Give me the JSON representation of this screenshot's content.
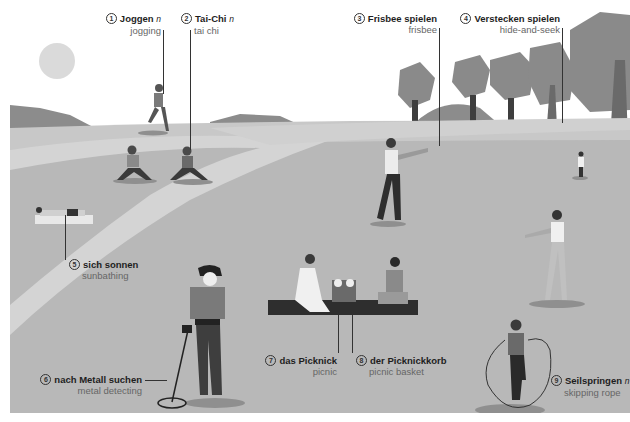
{
  "palette": {
    "sky": "#ffffff",
    "sun": "#dadada",
    "hills": "#8c8c8c",
    "grass_light": "#c8c8c8",
    "grass_mid": "#b4b4b4",
    "path": "#d4d4d4",
    "trees": "#8a8a8a",
    "trunks": "#3e3e3e",
    "text_dark": "#1e1e1e",
    "text_light": "#666666"
  },
  "labels": [
    {
      "num": "1",
      "german": "Joggen",
      "gender": "n",
      "english": "jogging"
    },
    {
      "num": "2",
      "german": "Tai-Chi",
      "gender": "n",
      "english": "tai chi"
    },
    {
      "num": "3",
      "german": "Frisbee spielen",
      "gender": "",
      "english": "frisbee"
    },
    {
      "num": "4",
      "german": "Verstecken spielen",
      "gender": "",
      "english": "hide-and-seek"
    },
    {
      "num": "5",
      "german": "sich sonnen",
      "gender": "",
      "english": "sunbathing"
    },
    {
      "num": "6",
      "german": "nach Metall suchen",
      "gender": "",
      "english": "metal detecting"
    },
    {
      "num": "7",
      "german": "das Picknick",
      "gender": "",
      "english": "picnic"
    },
    {
      "num": "8",
      "german": "der Picknickkorb",
      "gender": "",
      "english": "picnic basket"
    },
    {
      "num": "9",
      "german": "Seilspringen",
      "gender": "n",
      "english": "skipping rope"
    }
  ]
}
